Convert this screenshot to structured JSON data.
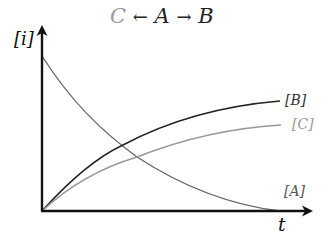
{
  "title": {
    "product_c": "C",
    "left_arrow": "←",
    "reactant_a": "A",
    "right_arrow": "→",
    "product_b": "B"
  },
  "axes": {
    "y_label": "[i]",
    "x_label": "t"
  },
  "curves": [
    {
      "name": "[A]",
      "label": "[A]",
      "color": "#666666",
      "shape": "exponential decay from high initial value to zero"
    },
    {
      "name": "[B]",
      "label": "[B]",
      "color": "#222222",
      "shape": "rises from zero, saturating (higher)"
    },
    {
      "name": "[C]",
      "label": "[C]",
      "color": "#999999",
      "shape": "rises from zero, saturating (lower)"
    }
  ]
}
